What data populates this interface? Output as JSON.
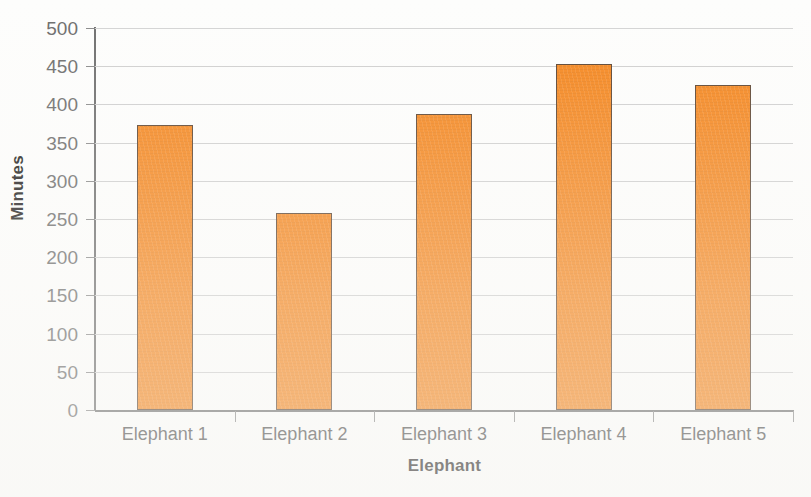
{
  "chart_data": {
    "type": "bar",
    "title": "",
    "categories": [
      "Elephant 1",
      "Elephant 2",
      "Elephant 3",
      "Elephant 4",
      "Elephant 5"
    ],
    "values": [
      373,
      258,
      387,
      453,
      425
    ],
    "xlabel": "Elephant",
    "ylabel": "Minutes",
    "ylim": [
      0,
      500
    ],
    "ytick_step": 50,
    "yticks": [
      0,
      50,
      100,
      150,
      200,
      250,
      300,
      350,
      400,
      450,
      500
    ],
    "ytick_labels": [
      "0",
      "50",
      "100",
      "150",
      "200",
      "250",
      "300",
      "350",
      "400",
      "450",
      "500"
    ],
    "grid": true,
    "grid_axis": "y",
    "legend": false,
    "series": [
      {
        "name": "Minutes",
        "values": [
          373,
          258,
          387,
          453,
          425
        ]
      }
    ]
  },
  "colors": {
    "bar_fill": "#f5871f",
    "bar_border": "#5b4330",
    "gridline": "#cfcfcf",
    "axis_line": "#6f6f6f",
    "tick_label": "#6d6d6d",
    "category_label": "#4a4a4a",
    "axis_title": "#231f20",
    "background": "#fdfdfc"
  }
}
